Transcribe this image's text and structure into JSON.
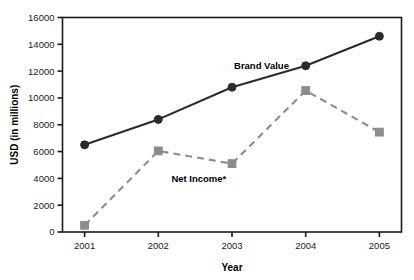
{
  "chart_data": {
    "type": "line",
    "title": "",
    "xlabel": "Year",
    "ylabel": "USD (in millions)",
    "categories": [
      "2001",
      "2002",
      "2003",
      "2004",
      "2005"
    ],
    "x": [
      2001,
      2002,
      2003,
      2004,
      2005
    ],
    "xlim": [
      2000.7,
      2005.3
    ],
    "ylim": [
      0,
      16000
    ],
    "ytick_values": [
      0,
      2000,
      4000,
      6000,
      8000,
      10000,
      12000,
      14000,
      16000
    ],
    "ytick_labels": [
      "0",
      "2000",
      "4000",
      "6000",
      "8000",
      "10000",
      "12000",
      "14000",
      "16000"
    ],
    "grid": false,
    "legend_position": "inline-annotation",
    "series": [
      {
        "name": "Brand Value",
        "values": [
          6500,
          8400,
          10800,
          12400,
          14600
        ],
        "color": "#2b2b2b",
        "line_style": "solid",
        "marker": "circle",
        "label_x": 2003.4,
        "label_y": 12150
      },
      {
        "name": "Net Income*",
        "values": [
          500,
          6050,
          5100,
          10550,
          7450
        ],
        "color": "#8c8c8c",
        "line_style": "dashed",
        "marker": "square",
        "label_x": 2002.55,
        "label_y": 3750
      }
    ]
  },
  "axis": {
    "y_title": "USD (in millions)",
    "x_title": "Year",
    "y_ticks": [
      "16000",
      "14000",
      "12000",
      "10000",
      "8000",
      "6000",
      "4000",
      "2000",
      "0"
    ],
    "x_ticks": [
      "2001",
      "2002",
      "2003",
      "2004",
      "2005"
    ]
  },
  "annotations": {
    "brand_value": "Brand Value",
    "net_income": "Net Income*"
  },
  "colors": {
    "brand_value": "#2b2b2b",
    "net_income": "#8c8c8c",
    "frame": "#1a1a1a",
    "background": "#ffffff"
  }
}
